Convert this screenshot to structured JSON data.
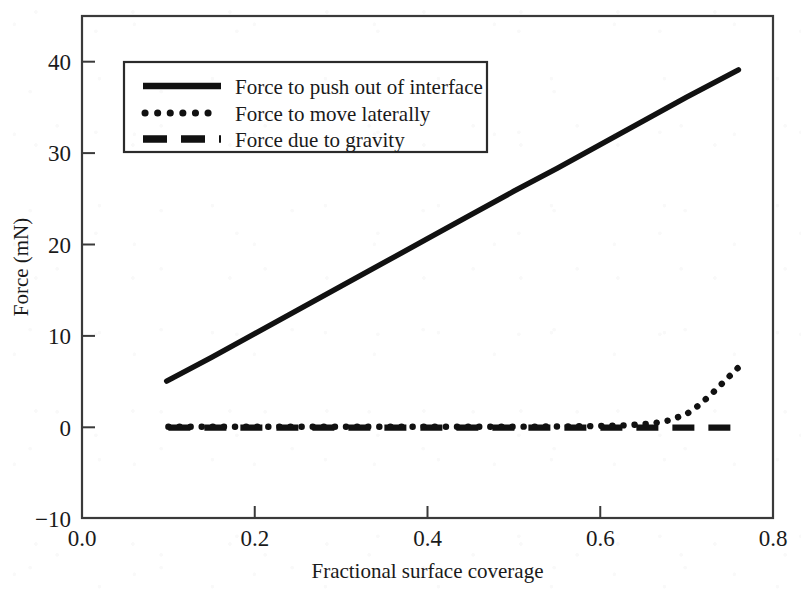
{
  "chart_data": {
    "type": "line",
    "title": "",
    "xlabel": "Fractional surface coverage",
    "ylabel": "Force (mN)",
    "xlim": [
      0.0,
      0.8
    ],
    "ylim": [
      -10,
      45
    ],
    "xticks": [
      "0.0",
      "0.2",
      "0.4",
      "0.6",
      "0.8"
    ],
    "xtick_values": [
      0.0,
      0.2,
      0.4,
      0.6,
      0.8
    ],
    "yticks": [
      "-10",
      "0",
      "10",
      "20",
      "30",
      "40"
    ],
    "ytick_values": [
      -10,
      0,
      10,
      20,
      30,
      40
    ],
    "grid": false,
    "legend_position": "upper left",
    "series": [
      {
        "name": "Force to push out of interface",
        "style": "solid",
        "color": "#111111",
        "x": [
          0.098,
          0.15,
          0.2,
          0.25,
          0.3,
          0.35,
          0.4,
          0.45,
          0.5,
          0.55,
          0.6,
          0.65,
          0.7,
          0.76
        ],
        "values": [
          5.0,
          7.6,
          10.2,
          12.8,
          15.4,
          18.0,
          20.6,
          23.2,
          25.8,
          28.3,
          30.9,
          33.5,
          36.1,
          39.1
        ]
      },
      {
        "name": "Force to move laterally",
        "style": "dotted",
        "color": "#111111",
        "x": [
          0.1,
          0.2,
          0.3,
          0.4,
          0.5,
          0.58,
          0.63,
          0.66,
          0.68,
          0.7,
          0.715,
          0.73,
          0.745,
          0.76
        ],
        "values": [
          0.0,
          0.0,
          0.0,
          0.0,
          0.0,
          0.05,
          0.15,
          0.35,
          0.7,
          1.4,
          2.4,
          3.7,
          5.1,
          6.5
        ]
      },
      {
        "name": "Force due to gravity",
        "style": "dashed",
        "color": "#111111",
        "x": [
          0.1,
          0.76
        ],
        "values": [
          -0.1,
          -0.1
        ]
      }
    ]
  },
  "legend": {
    "entries": [
      {
        "label": "Force to push out of interface",
        "style": "solid"
      },
      {
        "label": "Force to move laterally",
        "style": "dotted"
      },
      {
        "label": "Force due to gravity",
        "style": "dashed"
      }
    ]
  },
  "axes": {
    "y_title": "Force (mN)",
    "x_title": "Fractional surface coverage",
    "y_tick_labels": [
      "40",
      "30",
      "20",
      "10",
      "0",
      "−10"
    ],
    "x_tick_labels": [
      "0.0",
      "0.2",
      "0.4",
      "0.6",
      "0.8"
    ]
  }
}
